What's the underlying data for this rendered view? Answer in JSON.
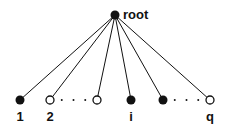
{
  "diagram": {
    "type": "tree",
    "root": {
      "id": "root",
      "label": "root",
      "style": "filled"
    },
    "children": [
      {
        "id": "c1",
        "label": "1",
        "style": "filled"
      },
      {
        "id": "c2",
        "label": "2",
        "style": "open"
      },
      {
        "id": "c3",
        "label": "",
        "style": "open"
      },
      {
        "id": "ci",
        "label": "i",
        "style": "filled"
      },
      {
        "id": "c5",
        "label": "",
        "style": "filled"
      },
      {
        "id": "cq",
        "label": "q",
        "style": "open"
      }
    ],
    "ellipses": [
      {
        "between": [
          "c2",
          "c3"
        ],
        "text": "· · ·"
      },
      {
        "between": [
          "c5",
          "cq"
        ],
        "text": "· · ·"
      }
    ],
    "colors": {
      "ink": "#111111",
      "background": "#ffffff"
    }
  }
}
